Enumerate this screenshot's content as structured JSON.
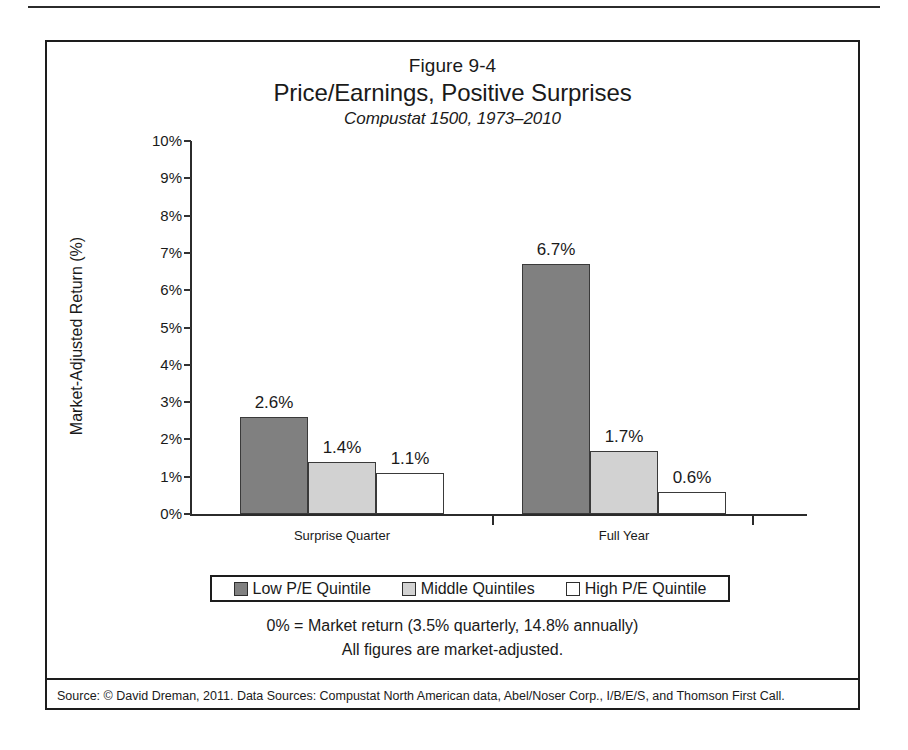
{
  "figure": {
    "number": "Figure 9-4",
    "title": "Price/Earnings, Positive Surprises",
    "subtitle": "Compustat 1500, 1973–2010"
  },
  "notes": {
    "line1": "0% = Market return (3.5% quarterly, 14.8% annually)",
    "line2": "All figures are market-adjusted."
  },
  "source": "Source: © David Dreman, 2011. Data Sources: Compustat North American data, Abel/Noser Corp., I/B/E/S, and Thomson First Call.",
  "colors": {
    "low_pe": "#808080",
    "middle": "#d2d2d2",
    "high_pe": "#ffffff",
    "outline": "#3a3a3a",
    "axis": "#2b2b2b"
  },
  "chart_data": {
    "type": "bar",
    "title": "Price/Earnings, Positive Surprises",
    "subtitle": "Compustat 1500, 1973–2010",
    "xlabel": "",
    "ylabel": "Market-Adjusted Return (%)",
    "ylim": [
      0,
      10
    ],
    "ytick_labels": [
      "10%",
      "9%",
      "8%",
      "7%",
      "6%",
      "5%",
      "4%",
      "3%",
      "2%",
      "1%",
      "0%"
    ],
    "ytick_values": [
      10,
      9,
      8,
      7,
      6,
      5,
      4,
      3,
      2,
      1,
      0
    ],
    "grid": false,
    "legend_position": "below-plot",
    "categories": [
      "Surprise Quarter",
      "Full Year"
    ],
    "series": [
      {
        "name": "Low P/E Quintile",
        "color": "#808080",
        "values": [
          2.6,
          6.7
        ],
        "labels": [
          "2.6%",
          "6.7%"
        ]
      },
      {
        "name": "Middle Quintiles",
        "color": "#d2d2d2",
        "values": [
          1.4,
          1.7
        ],
        "labels": [
          "1.4%",
          "1.7%"
        ]
      },
      {
        "name": "High P/E Quintile",
        "color": "#ffffff",
        "values": [
          1.1,
          0.6
        ],
        "labels": [
          "1.1%",
          "0.6%"
        ]
      }
    ],
    "annotations": [
      "0% = Market return (3.5% quarterly, 14.8% annually)",
      "All figures are market-adjusted."
    ]
  }
}
